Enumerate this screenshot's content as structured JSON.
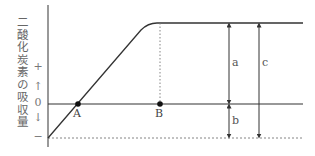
{
  "diagram": {
    "y_axis_label": "二酸化炭素の吸収量",
    "ticks": {
      "plus": "+",
      "up_arrow": "↑",
      "zero": "0",
      "down_arrow": "↓",
      "minus": "−"
    },
    "points": {
      "A": "A",
      "B": "B"
    },
    "dimensions": {
      "a": "a",
      "b": "b",
      "c": "c"
    },
    "colors": {
      "line": "#333333",
      "dashed": "#777777",
      "text": "#555555"
    }
  }
}
